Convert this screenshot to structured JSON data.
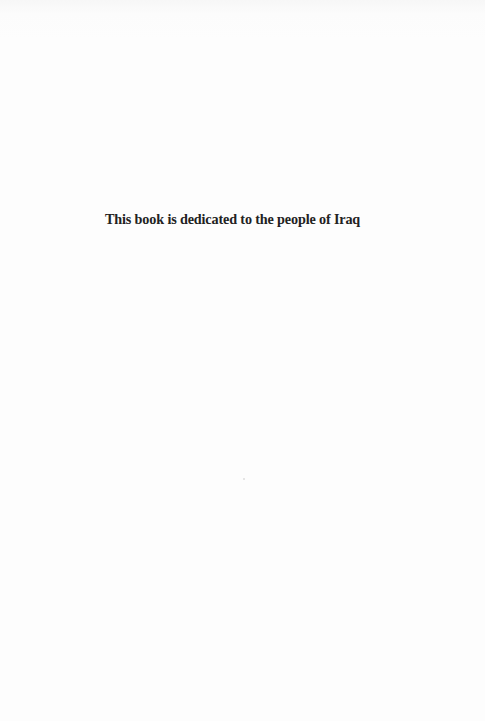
{
  "page": {
    "type": "dedication",
    "dedication_text": "This book is dedicated to the people of Iraq",
    "colors": {
      "background": "#fdfdfd",
      "text": "#222222"
    }
  }
}
